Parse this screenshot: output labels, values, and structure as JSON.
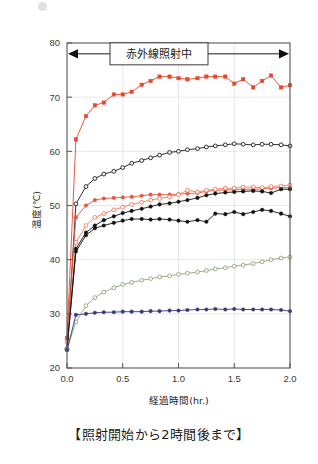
{
  "caption": "【照射開始から2時間後まで】",
  "corner_mark": "gray-dot",
  "annotation": {
    "label": "赤外線照射中",
    "arrow": "double-headed-arrow",
    "y_value": 78
  },
  "chart_data": {
    "type": "line",
    "title": "",
    "xlabel": "経過時間(hr.)",
    "ylabel": "温度(℃)",
    "xlim": [
      0.0,
      2.0
    ],
    "ylim": [
      20,
      80
    ],
    "xticks": [
      "0.0",
      "0.5",
      "1.0",
      "1.5",
      "2.0"
    ],
    "xtick_values": [
      0.0,
      0.5,
      1.0,
      1.5,
      2.0
    ],
    "yticks": [
      "20",
      "30",
      "40",
      "50",
      "60",
      "70",
      "80"
    ],
    "ytick_values": [
      20,
      30,
      40,
      50,
      60,
      70,
      80
    ],
    "grid": true,
    "legend": "none",
    "x": [
      0.0,
      0.08,
      0.17,
      0.25,
      0.33,
      0.42,
      0.5,
      0.58,
      0.67,
      0.75,
      0.83,
      0.92,
      1.0,
      1.08,
      1.17,
      1.25,
      1.33,
      1.42,
      1.5,
      1.58,
      1.67,
      1.75,
      1.83,
      1.92,
      2.0
    ],
    "series": [
      {
        "name": "series-red-filled-square-top",
        "color": "#e8472c",
        "marker": "filled-square",
        "values": [
          25.5,
          62.2,
          66.5,
          68.5,
          69.0,
          70.5,
          70.5,
          71.0,
          72.3,
          73.0,
          73.8,
          73.8,
          73.5,
          73.3,
          73.5,
          73.8,
          73.8,
          73.8,
          72.5,
          73.3,
          71.8,
          73.0,
          74.0,
          71.8,
          72.2
        ]
      },
      {
        "name": "series-black-open-circle",
        "color": "#1a1a1a",
        "marker": "open-circle",
        "values": [
          23.5,
          50.3,
          53.5,
          55.0,
          55.8,
          56.3,
          57.0,
          57.8,
          58.3,
          58.8,
          59.3,
          59.8,
          60.0,
          60.3,
          60.5,
          60.8,
          61.0,
          61.2,
          61.4,
          61.3,
          61.2,
          61.3,
          61.3,
          61.2,
          61.0
        ]
      },
      {
        "name": "series-red-filled-circle",
        "color": "#e8543a",
        "marker": "filled-circle",
        "values": [
          25.5,
          47.8,
          50.0,
          51.0,
          51.3,
          51.4,
          51.5,
          51.6,
          51.8,
          52.0,
          52.0,
          52.0,
          52.1,
          52.2,
          52.3,
          52.6,
          52.8,
          52.9,
          52.9,
          53.0,
          53.0,
          53.1,
          53.2,
          53.3,
          53.3
        ]
      },
      {
        "name": "series-red-open-circle",
        "color": "#ef7a5e",
        "marker": "open-circle",
        "values": [
          24.8,
          43.2,
          46.3,
          47.8,
          48.5,
          49.2,
          49.7,
          50.2,
          50.6,
          51.0,
          51.3,
          51.6,
          52.0,
          52.8,
          52.5,
          52.8,
          53.0,
          53.2,
          53.2,
          53.4,
          53.4,
          53.3,
          53.5,
          53.6,
          53.8
        ]
      },
      {
        "name": "series-black-filled-circle-upper",
        "color": "#111111",
        "marker": "filled-circle",
        "values": [
          23.5,
          42.0,
          45.0,
          46.3,
          47.3,
          48.0,
          48.6,
          49.0,
          49.4,
          49.8,
          50.2,
          50.4,
          50.7,
          51.0,
          51.4,
          51.9,
          52.2,
          52.4,
          52.5,
          52.6,
          52.7,
          52.6,
          52.3,
          53.0,
          53.0
        ]
      },
      {
        "name": "series-black-filled-circle-lower",
        "color": "#111111",
        "marker": "filled-circle",
        "values": [
          23.5,
          41.5,
          44.5,
          45.8,
          46.3,
          46.8,
          47.2,
          47.5,
          47.5,
          47.4,
          47.5,
          47.4,
          47.2,
          47.0,
          47.3,
          47.0,
          48.5,
          48.4,
          48.8,
          48.4,
          48.8,
          49.2,
          49.0,
          48.5,
          48.0
        ]
      },
      {
        "name": "series-green-open-circle",
        "color": "#8ea37c",
        "marker": "open-circle",
        "values": [
          23.5,
          28.5,
          31.5,
          33.0,
          34.0,
          34.8,
          35.4,
          35.8,
          36.2,
          36.5,
          36.8,
          37.0,
          37.3,
          37.5,
          37.7,
          38.0,
          38.3,
          38.5,
          38.8,
          39.0,
          39.3,
          39.6,
          40.0,
          40.3,
          40.5
        ]
      },
      {
        "name": "series-navy-filled-circle",
        "color": "#39397a",
        "marker": "filled-circle",
        "values": [
          23.3,
          29.8,
          30.0,
          30.2,
          30.3,
          30.3,
          30.4,
          30.4,
          30.4,
          30.5,
          30.5,
          30.6,
          30.6,
          30.7,
          30.8,
          30.8,
          30.9,
          30.8,
          30.9,
          30.8,
          30.8,
          30.8,
          30.8,
          30.7,
          30.5
        ]
      }
    ]
  }
}
